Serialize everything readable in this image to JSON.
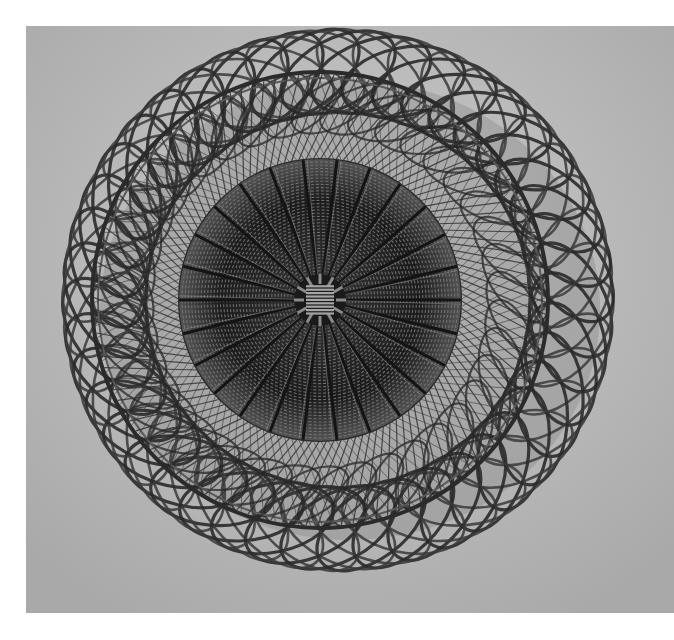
{
  "image": {
    "kind": "black-and-white photograph",
    "subject": "woven wicker basket viewed from above",
    "description": "Open lattice rings of crisscrossing cane around a rim hoop and a densely woven circular base with a square center knot",
    "colors": {
      "margin": "#ffffff",
      "backdrop": "#b9b9b9",
      "backdrop_light": "#cfcfcf",
      "cane_dark": "#2a2a2a",
      "cane_mid": "#4a4a4a",
      "base_dark": "#1f1f1f",
      "shadow": "#151515"
    },
    "layout": {
      "photo_rect": [
        26,
        26,
        674,
        613
      ],
      "basket_center": [
        335,
        300
      ],
      "outer_radius": 290,
      "rim_radius": 228,
      "base_radius": 142,
      "knot_size": 46
    }
  }
}
